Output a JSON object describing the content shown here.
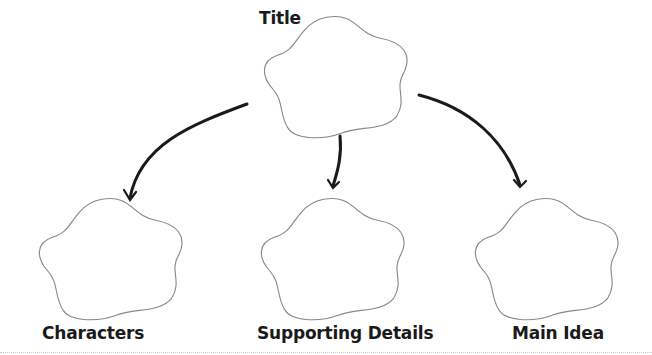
{
  "diagram": {
    "type": "graphic-organizer",
    "colors": {
      "outline": "#888888",
      "arrow": "#1a1a1a",
      "text": "#1a1a1a"
    },
    "nodes": [
      {
        "id": "title",
        "label": "Title",
        "role": "top"
      },
      {
        "id": "characters",
        "label": "Characters",
        "role": "child"
      },
      {
        "id": "supporting",
        "label": "Supporting Details",
        "role": "child"
      },
      {
        "id": "main",
        "label": "Main Idea",
        "role": "child"
      }
    ],
    "edges": [
      {
        "from": "title",
        "to": "characters"
      },
      {
        "from": "title",
        "to": "supporting"
      },
      {
        "from": "title",
        "to": "main"
      }
    ]
  }
}
